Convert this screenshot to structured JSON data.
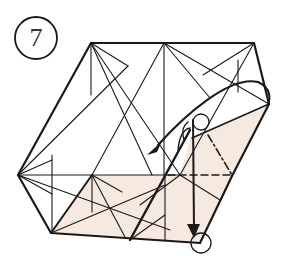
{
  "diagram": {
    "step_number": "7",
    "colors": {
      "line": "#1a1a1a",
      "shade": "#f6e9e0",
      "background": "#ffffff"
    },
    "symbols": {
      "step_circle": "circle-7",
      "valley_fold": "dashed-line",
      "mountain_fold": "dash-dot-line",
      "arrow_fold_over": "curved-arrow",
      "arrow_move": "straight-arrow",
      "reference_points": [
        "circle-marker-top",
        "circle-marker-bottom"
      ]
    }
  }
}
